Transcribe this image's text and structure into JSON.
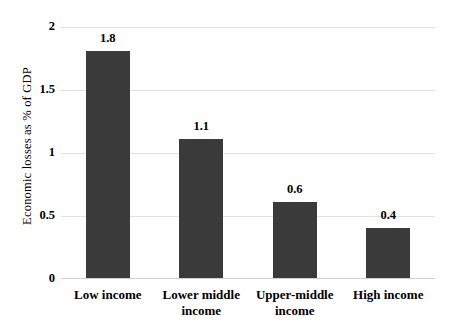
{
  "chart_data": {
    "type": "bar",
    "title": "",
    "xlabel": "",
    "ylabel": "Economic losses as % of GDP",
    "categories": [
      "Low income",
      "Lower middle income",
      "Upper-middle income",
      "High income"
    ],
    "values": [
      1.8,
      1.1,
      0.6,
      0.4
    ],
    "value_labels": [
      "1.8",
      "1.1",
      "0.6",
      "0.4"
    ],
    "ylim": [
      0,
      2
    ],
    "yticks": [
      0,
      0.5,
      1,
      1.5,
      2
    ],
    "ytick_labels": [
      "0",
      "0.5",
      "1",
      "1.5",
      "2"
    ],
    "grid": true,
    "legend": false,
    "colors": {
      "bar": "#3a3a3a",
      "gridline": "#e2e2e2",
      "axis_line": "#d0d0d0",
      "text": "#000000",
      "background": "#ffffff"
    }
  }
}
